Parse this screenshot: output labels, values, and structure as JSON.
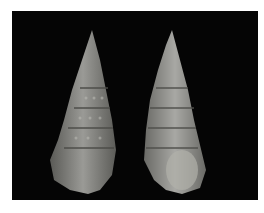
{
  "image": {
    "description": "Two elongated, spirally ribbed gastropod shells photographed side by side on a black background",
    "background_color": "#050505",
    "border_color": "#ffffff",
    "subjects": [
      {
        "name": "left-shell",
        "view": "dorsal",
        "color": "#8a8a86"
      },
      {
        "name": "right-shell",
        "view": "apertural",
        "color": "#9a9a96"
      }
    ]
  }
}
